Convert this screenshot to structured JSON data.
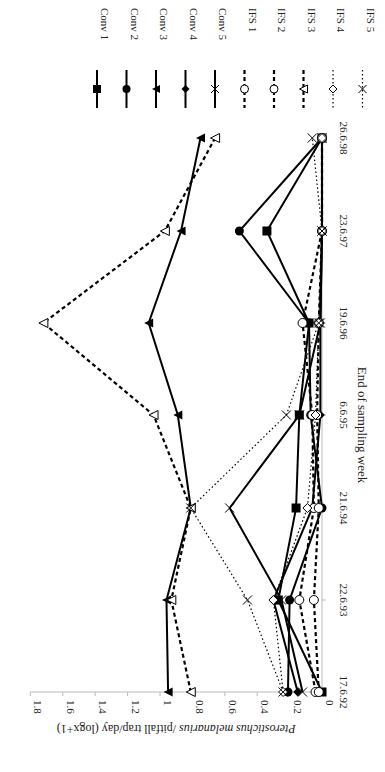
{
  "chart_data": {
    "type": "line",
    "orientation": "rotated-90-clockwise",
    "title": "",
    "xlabel": "End of sampling week",
    "ylabel": "Pterostichus melanarius /pitfall trap/day (logx+1)",
    "ylabel_italic_part": "Pterostichus melanarius",
    "ylabel_rest": " /pitfall trap/day (logx+1)",
    "categories": [
      "17.6.92",
      "22.6.93",
      "21.6.94",
      "6.6.95",
      "19.6.96",
      "23.6.97",
      "26.6.98"
    ],
    "ylim": [
      0,
      1.8
    ],
    "yticks": [
      "0",
      "0.2",
      "0.4",
      "0.6",
      "0.8",
      "1",
      "1.2",
      "1.4",
      "1.6",
      "1.8"
    ],
    "grid": false,
    "legend_position": "top-right",
    "series": [
      {
        "name": "Conv 1",
        "marker": "square-filled",
        "line": "solid",
        "values": [
          0.0,
          0.27,
          0.16,
          0.14,
          0.08,
          0.34,
          0.0
        ]
      },
      {
        "name": "Conv 2",
        "marker": "circle-filled",
        "line": "solid",
        "values": [
          0.21,
          0.2,
          0.0,
          0.07,
          0.08,
          0.51,
          0.0
        ]
      },
      {
        "name": "Conv 3",
        "marker": "triangle-filled",
        "line": "solid",
        "values": [
          0.95,
          0.96,
          0.81,
          0.89,
          1.07,
          0.87,
          0.75
        ]
      },
      {
        "name": "Conv 4",
        "marker": "diamond-filled",
        "line": "solid",
        "values": [
          0.15,
          0.3,
          0.06,
          0.01,
          0.01,
          0.0,
          0.0
        ]
      },
      {
        "name": "Conv 5",
        "marker": "x",
        "line": "solid",
        "values": [
          0.12,
          0.25,
          0.57,
          0.14,
          0.01,
          0.0,
          0.0
        ]
      },
      {
        "name": "IFS 1",
        "marker": "circle-open",
        "line": "dashed",
        "values": [
          0.04,
          0.14,
          0.05,
          0.06,
          0.12,
          0.0,
          0.0
        ]
      },
      {
        "name": "IFS 2",
        "marker": "circle-open",
        "line": "dashed",
        "values": [
          0.02,
          0.05,
          0.02,
          0.03,
          0.02,
          0.0,
          0.0
        ]
      },
      {
        "name": "IFS 3",
        "marker": "triangle-open",
        "line": "dashed",
        "values": [
          0.81,
          0.93,
          0.81,
          1.04,
          1.72,
          0.97,
          0.66
        ]
      },
      {
        "name": "IFS 4",
        "marker": "diamond-open",
        "line": "dotted",
        "values": [
          0.24,
          0.3,
          0.09,
          0.04,
          0.02,
          0.0,
          0.0
        ]
      },
      {
        "name": "IFS 5",
        "marker": "x",
        "line": "dotted",
        "values": [
          0.24,
          0.46,
          0.81,
          0.22,
          0.02,
          0.0,
          0.06
        ]
      }
    ]
  },
  "layout": {
    "zero_x": 322,
    "px_per_unit": 162,
    "axis_y": 692,
    "cat_y": [
      692,
      600,
      508,
      415,
      323,
      231,
      138
    ]
  }
}
